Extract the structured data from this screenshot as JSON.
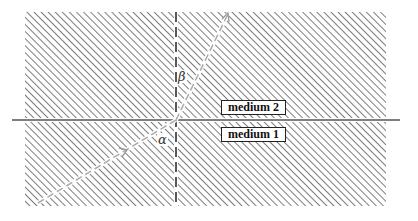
{
  "diagram": {
    "type": "refraction-diagram",
    "media": [
      {
        "id": "upper",
        "label": "medium 2"
      },
      {
        "id": "lower",
        "label": "medium 1"
      }
    ],
    "angles": {
      "incidence": "α",
      "refraction": "β"
    },
    "colors": {
      "hatch": "#444444",
      "interface": "#555555",
      "ray": "#aaaaaa",
      "normal": "#222222"
    }
  }
}
